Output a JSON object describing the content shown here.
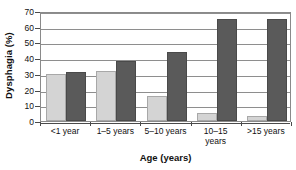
{
  "chart_data": {
    "type": "bar",
    "title": "",
    "xlabel": "Age (years)",
    "ylabel": "Dysphagia (%)",
    "categories": [
      "<1 year",
      "1–5 years",
      "5–10 years",
      "10–15\nyears",
      ">15 years"
    ],
    "series": [
      {
        "name": "light-series",
        "values": [
          30,
          32,
          16,
          5,
          3
        ],
        "color": "#d4d4d4"
      },
      {
        "name": "dark-series",
        "values": [
          31,
          38,
          44,
          65,
          65
        ],
        "color": "#5a5a5a"
      }
    ],
    "ylim": [
      0,
      70
    ],
    "yticks": [
      0,
      10,
      20,
      30,
      40,
      50,
      60,
      70
    ],
    "ytick_labels": [
      "0",
      "10",
      "20",
      "30",
      "40",
      "50",
      "60",
      "70"
    ],
    "grid": true,
    "grid_axis": "y",
    "legend": "none",
    "legend_position": "none",
    "plot_border": true,
    "border_color": "#8a8a8a",
    "gridline_color": "#8e8e8e",
    "background": "#ffffff"
  }
}
